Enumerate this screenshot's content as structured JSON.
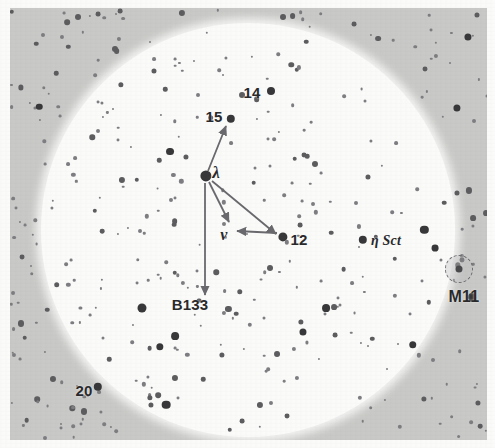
{
  "chart": {
    "kind": "star-chart",
    "background_color": "#c9c9c7",
    "field_color": "#fbfbfa",
    "star_color": "#38383a",
    "label_color": "#2a2a2c",
    "arrow_color": "#6a6a6e"
  },
  "field_of_view": {
    "center_x": 248,
    "center_y": 230,
    "radius": 207
  },
  "labels": [
    {
      "name": "label-14",
      "text": "14",
      "x": 252,
      "y": 92,
      "size": 15,
      "style": "num"
    },
    {
      "name": "label-15",
      "text": "15",
      "x": 214,
      "y": 116,
      "size": 15,
      "style": "num"
    },
    {
      "name": "label-lambda",
      "text": "λ",
      "x": 216,
      "y": 173,
      "size": 17,
      "style": "greek"
    },
    {
      "name": "label-nu",
      "text": "ν",
      "x": 224,
      "y": 235,
      "size": 16,
      "style": "greek"
    },
    {
      "name": "label-12",
      "text": "12",
      "x": 299,
      "y": 239,
      "size": 15,
      "style": "num"
    },
    {
      "name": "label-eta-sct",
      "text": "η Sct",
      "x": 386,
      "y": 241,
      "size": 14,
      "style": "greek"
    },
    {
      "name": "label-m11",
      "text": "M11",
      "x": 464,
      "y": 297,
      "size": 16,
      "style": "cluster-name"
    },
    {
      "name": "label-b133",
      "text": "B133",
      "x": 190,
      "y": 304,
      "size": 15,
      "style": "desig"
    },
    {
      "name": "label-20",
      "text": "20",
      "x": 84,
      "y": 390,
      "size": 15,
      "style": "num"
    }
  ],
  "named_stars": [
    {
      "name": "star-14",
      "x": 271,
      "y": 91,
      "r": 4.0
    },
    {
      "name": "star-15",
      "x": 231,
      "y": 119,
      "r": 4.2
    },
    {
      "name": "star-lambda",
      "x": 206,
      "y": 176,
      "r": 5.6
    },
    {
      "name": "star-12",
      "x": 283,
      "y": 237,
      "r": 4.6
    },
    {
      "name": "star-eta-sct",
      "x": 363,
      "y": 240,
      "r": 4.2
    },
    {
      "name": "star-20",
      "x": 98,
      "y": 387,
      "r": 4.2
    }
  ],
  "cluster": {
    "name": "m11-cluster-glyph",
    "x": 459,
    "y": 269,
    "r": 13
  },
  "arrows": [
    {
      "name": "arrow-lambda-to-15",
      "x1": 208,
      "y1": 171,
      "x2": 226,
      "y2": 126
    },
    {
      "name": "arrow-lambda-to-12",
      "x1": 212,
      "y1": 181,
      "x2": 276,
      "y2": 234
    },
    {
      "name": "arrow-lambda-to-nu",
      "x1": 209,
      "y1": 182,
      "x2": 229,
      "y2": 222
    },
    {
      "name": "arrow-lambda-to-b133",
      "x1": 205,
      "y1": 183,
      "x2": 205,
      "y2": 295
    },
    {
      "name": "arrow-12-to-nu",
      "x1": 277,
      "y1": 233,
      "x2": 237,
      "y2": 231
    }
  ],
  "star_field": {
    "description": "Dense Milky Way star field of Scutum rendered as scattered dots",
    "inside_count": 232,
    "outside_count": 148
  }
}
